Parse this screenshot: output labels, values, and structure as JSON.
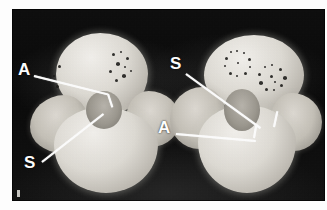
{
  "figure": {
    "type": "photomicrograph",
    "background_color": "#0b0b0b",
    "plate_border_color": "#fdfdfd",
    "annotation_color": "#ffffff",
    "specimen_color": "#e4e1da",
    "pigment_spot_color": "#1d1c1a"
  },
  "annotations": [
    {
      "id": "left-a",
      "label": "A",
      "specimen": "left",
      "label_x": 6,
      "label_y": 52,
      "line_x": 22,
      "line_y": 66,
      "line_length": 76,
      "line_angle": 14
    },
    {
      "id": "left-s",
      "label": "S",
      "specimen": "left",
      "label_x": 12,
      "label_y": 145,
      "line_x": 30,
      "line_y": 152,
      "line_length": 78,
      "line_angle": -38
    },
    {
      "id": "right-s",
      "label": "S",
      "specimen": "right",
      "label_x": 158,
      "label_y": 46,
      "line_x": 174,
      "line_y": 64,
      "line_length": 92,
      "line_angle": 36
    },
    {
      "id": "right-a",
      "label": "A",
      "specimen": "right",
      "label_x": 146,
      "label_y": 110,
      "line_x": 164,
      "line_y": 124,
      "line_length": 80,
      "line_angle": 5
    }
  ],
  "legend": {
    "A": "A",
    "S": "S"
  }
}
